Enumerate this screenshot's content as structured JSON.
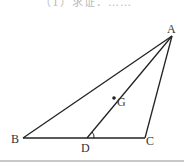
{
  "header": {
    "cutoff_text": "（1）求证：……"
  },
  "diagram": {
    "type": "geometry-triangle",
    "stroke_color": "#222222",
    "points": {
      "A": {
        "label": "A",
        "x": 172,
        "y": 36
      },
      "B": {
        "label": "B",
        "x": 23,
        "y": 138
      },
      "C": {
        "label": "C",
        "x": 145,
        "y": 138
      },
      "D": {
        "label": "D",
        "x": 87,
        "y": 138
      },
      "G": {
        "label": "G",
        "x": 114,
        "y": 98
      }
    },
    "segments": [
      "AB",
      "AC",
      "BC",
      "AD"
    ],
    "angle_marks": [
      "ADC"
    ],
    "marked_points": [
      "G"
    ]
  }
}
